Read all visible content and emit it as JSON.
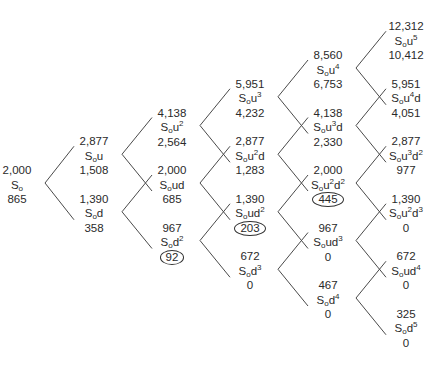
{
  "diagram": {
    "type": "binomial-tree",
    "periods": 5,
    "base_label": "S",
    "base_subscript": "o",
    "line_color": "#4a4a4a",
    "nodes": [
      {
        "id": "n0_0",
        "col": 0,
        "row": 0,
        "price": "2,000",
        "u": 0,
        "d": 0,
        "value": "865",
        "circled": false
      },
      {
        "id": "n1_0",
        "col": 1,
        "row": 0,
        "price": "2,877",
        "u": 1,
        "d": 0,
        "value": "1,508",
        "circled": false
      },
      {
        "id": "n1_1",
        "col": 1,
        "row": 1,
        "price": "1,390",
        "u": 0,
        "d": 1,
        "value": "358",
        "circled": false
      },
      {
        "id": "n2_0",
        "col": 2,
        "row": 0,
        "price": "4,138",
        "u": 2,
        "d": 0,
        "value": "2,564",
        "circled": false
      },
      {
        "id": "n2_1",
        "col": 2,
        "row": 1,
        "price": "2,000",
        "u": 1,
        "d": 1,
        "value": "685",
        "circled": false
      },
      {
        "id": "n2_2",
        "col": 2,
        "row": 2,
        "price": "967",
        "u": 0,
        "d": 2,
        "value": "92",
        "circled": true
      },
      {
        "id": "n3_0",
        "col": 3,
        "row": 0,
        "price": "5,951",
        "u": 3,
        "d": 0,
        "value": "4,232",
        "circled": false
      },
      {
        "id": "n3_1",
        "col": 3,
        "row": 1,
        "price": "2,877",
        "u": 2,
        "d": 1,
        "value": "1,283",
        "circled": false
      },
      {
        "id": "n3_2",
        "col": 3,
        "row": 2,
        "price": "1,390",
        "u": 1,
        "d": 2,
        "value": "203",
        "circled": true
      },
      {
        "id": "n3_3",
        "col": 3,
        "row": 3,
        "price": "672",
        "u": 0,
        "d": 3,
        "value": "0",
        "circled": false
      },
      {
        "id": "n4_0",
        "col": 4,
        "row": 0,
        "price": "8,560",
        "u": 4,
        "d": 0,
        "value": "6,753",
        "circled": false
      },
      {
        "id": "n4_1",
        "col": 4,
        "row": 1,
        "price": "4,138",
        "u": 3,
        "d": 1,
        "value": "2,330",
        "circled": false
      },
      {
        "id": "n4_2",
        "col": 4,
        "row": 2,
        "price": "2,000",
        "u": 2,
        "d": 2,
        "value": "445",
        "circled": true
      },
      {
        "id": "n4_3",
        "col": 4,
        "row": 3,
        "price": "967",
        "u": 1,
        "d": 3,
        "value": "0",
        "circled": false
      },
      {
        "id": "n4_4",
        "col": 4,
        "row": 4,
        "price": "467",
        "u": 0,
        "d": 4,
        "value": "0",
        "circled": false
      },
      {
        "id": "n5_0",
        "col": 5,
        "row": 0,
        "price": "12,312",
        "u": 5,
        "d": 0,
        "value": "10,412",
        "circled": false
      },
      {
        "id": "n5_1",
        "col": 5,
        "row": 1,
        "price": "5,951",
        "u": 4,
        "d": 1,
        "value": "4,051",
        "circled": false
      },
      {
        "id": "n5_2",
        "col": 5,
        "row": 2,
        "price": "2,877",
        "u": 3,
        "d": 2,
        "value": "977",
        "circled": false
      },
      {
        "id": "n5_3",
        "col": 5,
        "row": 3,
        "price": "1,390",
        "u": 2,
        "d": 3,
        "value": "0",
        "circled": false
      },
      {
        "id": "n5_4",
        "col": 5,
        "row": 4,
        "price": "672",
        "u": 1,
        "d": 4,
        "value": "0",
        "circled": false
      },
      {
        "id": "n5_5",
        "col": 5,
        "row": 5,
        "price": "325",
        "u": 0,
        "d": 5,
        "value": "0",
        "circled": false
      }
    ]
  }
}
